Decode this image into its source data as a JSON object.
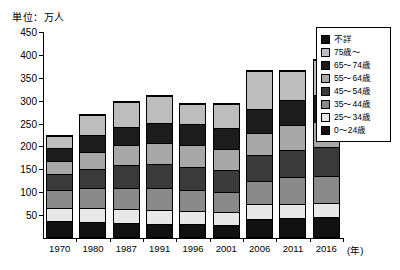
{
  "chart_data": {
    "type": "bar",
    "stacked": true,
    "title": "",
    "unit_caption": "単位：万人",
    "xlabel": "(年)",
    "ylabel": "",
    "ylim": [
      0,
      450
    ],
    "ytick_step": 50,
    "yticks": [
      0,
      50,
      100,
      150,
      200,
      250,
      300,
      350,
      400,
      450
    ],
    "ytick_labels": [
      "0",
      "50",
      "100",
      "150",
      "200",
      "250",
      "300",
      "350",
      "400",
      "450"
    ],
    "grid": false,
    "legend_position": "right",
    "categories": [
      "1970",
      "1980",
      "1987",
      "1991",
      "1996",
      "2001",
      "2006",
      "2011",
      "2016"
    ],
    "series": [
      {
        "name": "0〜24歳",
        "color": "#111111",
        "values": [
          32,
          30,
          28,
          27,
          26,
          25,
          38,
          40,
          42
        ]
      },
      {
        "name": "25〜34歳",
        "color": "#e8e8e8",
        "values": [
          30,
          32,
          31,
          30,
          29,
          28,
          31,
          30,
          30
        ]
      },
      {
        "name": "35〜44歳",
        "color": "#8a8a8a",
        "values": [
          38,
          42,
          46,
          48,
          45,
          43,
          52,
          58,
          60
        ]
      },
      {
        "name": "45〜54歳",
        "color": "#3a3a3a",
        "values": [
          35,
          42,
          50,
          52,
          50,
          48,
          55,
          60,
          62
        ]
      },
      {
        "name": "55〜64歳",
        "color": "#a8a8a8",
        "values": [
          30,
          38,
          44,
          46,
          48,
          47,
          50,
          54,
          56
        ]
      },
      {
        "name": "65〜74歳",
        "color": "#1c1c1c",
        "values": [
          28,
          36,
          40,
          44,
          46,
          45,
          52,
          56,
          58
        ]
      },
      {
        "name": "75歳〜",
        "color": "#bdbdbd",
        "values": [
          26,
          44,
          54,
          59,
          44,
          52,
          83,
          62,
          77
        ]
      },
      {
        "name": "不詳",
        "color": "#111111",
        "values": [
          2,
          2,
          2,
          2,
          2,
          2,
          2,
          2,
          2
        ]
      }
    ],
    "totals": [
      221,
      266,
      295,
      308,
      290,
      290,
      363,
      362,
      387
    ]
  },
  "legend": {
    "entries": [
      {
        "label": "不詳",
        "color": "#111111"
      },
      {
        "label": "75歳〜",
        "color": "#bdbdbd"
      },
      {
        "label": "65〜74歳",
        "color": "#1c1c1c"
      },
      {
        "label": "55〜64歳",
        "color": "#a8a8a8"
      },
      {
        "label": "45〜54歳",
        "color": "#3a3a3a"
      },
      {
        "label": "35〜44歳",
        "color": "#8a8a8a"
      },
      {
        "label": "25〜34歳",
        "color": "#e8e8e8"
      },
      {
        "label": "0〜24歳",
        "color": "#111111"
      }
    ]
  }
}
